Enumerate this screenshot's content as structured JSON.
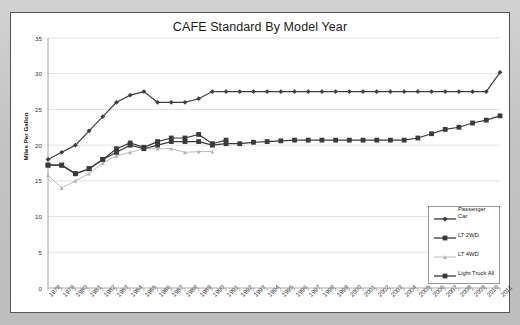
{
  "chart_data": {
    "type": "line",
    "title": "CAFE Standard By Model Year",
    "xlabel": "",
    "ylabel": "Miles Per Gallon",
    "ylim": [
      0,
      35
    ],
    "ytick_step": 5,
    "yticks": [
      0,
      5,
      10,
      15,
      20,
      25,
      30,
      35
    ],
    "grid": true,
    "legend_position": "bottom-right",
    "categories": [
      "1978",
      "1979",
      "1980",
      "1981",
      "1982",
      "1983",
      "1984",
      "1985",
      "1986",
      "1987",
      "1988",
      "1989",
      "1990",
      "1991",
      "1992",
      "1993",
      "1994",
      "1995",
      "1996",
      "1997",
      "1998",
      "1999",
      "2000",
      "2001",
      "2002",
      "2003",
      "2004",
      "2005",
      "2006",
      "2007",
      "2008",
      "2009",
      "2010",
      "2011"
    ],
    "series": [
      {
        "name": "Passenger Car",
        "marker": "diamond",
        "color": "#3f3f3f",
        "values": [
          18.0,
          19.0,
          20.0,
          22.0,
          24.0,
          26.0,
          27.0,
          27.5,
          26.0,
          26.0,
          26.0,
          26.5,
          27.5,
          27.5,
          27.5,
          27.5,
          27.5,
          27.5,
          27.5,
          27.5,
          27.5,
          27.5,
          27.5,
          27.5,
          27.5,
          27.5,
          27.5,
          27.5,
          27.5,
          27.5,
          27.5,
          27.5,
          27.5,
          30.2
        ]
      },
      {
        "name": "LT 2WD",
        "marker": "square",
        "color": "#3a3a3a",
        "values": [
          17.2,
          17.2,
          16.0,
          16.7,
          18.0,
          19.5,
          20.3,
          19.7,
          20.5,
          21.0,
          21.0,
          21.5,
          20.2,
          20.7,
          null,
          null,
          null,
          null,
          null,
          null,
          null,
          null,
          null,
          null,
          null,
          null,
          null,
          null,
          null,
          null,
          null,
          null,
          null,
          null
        ]
      },
      {
        "name": "LT 4WD",
        "marker": "triangle",
        "color": "#b3b3b3",
        "values": [
          15.8,
          14.0,
          15.0,
          16.0,
          17.5,
          18.5,
          19.0,
          19.5,
          19.5,
          19.5,
          19.0,
          19.1,
          19.1,
          null,
          null,
          null,
          null,
          null,
          null,
          null,
          null,
          null,
          null,
          null,
          null,
          null,
          null,
          null,
          null,
          null,
          null,
          null,
          null,
          null
        ]
      },
      {
        "name": "Light Truck All",
        "marker": "square",
        "color": "#3a3a3a",
        "values": [
          17.2,
          17.2,
          16.0,
          16.7,
          18.0,
          19.0,
          20.0,
          19.5,
          20.0,
          20.5,
          20.5,
          20.5,
          20.0,
          20.2,
          20.2,
          20.4,
          20.5,
          20.6,
          20.7,
          20.7,
          20.7,
          20.7,
          20.7,
          20.7,
          20.7,
          20.7,
          20.7,
          21.0,
          21.6,
          22.2,
          22.5,
          23.1,
          23.5,
          24.1
        ]
      }
    ]
  },
  "legend": {
    "items": [
      {
        "label": "Passenger",
        "label2": "Car",
        "marker": "diamond"
      },
      {
        "label": "LT 2WD",
        "marker": "square"
      },
      {
        "label": "LT 4WD",
        "marker": "triangle"
      },
      {
        "label": "Light Truck All",
        "marker": "square"
      }
    ]
  },
  "colors": {
    "panel_background": "#ffffff",
    "outer_background": "#c8c8c8",
    "grid": "#d9d9d9",
    "axis": "#9a9a9a",
    "dark_series": "#3a3a3a",
    "light_series": "#b3b3b3"
  }
}
